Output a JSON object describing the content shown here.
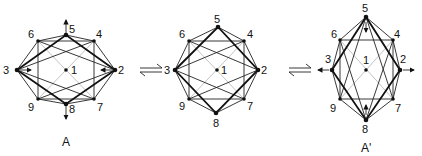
{
  "figure": {
    "type": "rearrangement-diagram",
    "panels": [
      {
        "id": "A",
        "caption": "A",
        "nodes": {
          "1": [
            66,
            70
          ],
          "2": [
            115,
            70
          ],
          "3": [
            17,
            70
          ],
          "4": [
            94,
            41
          ],
          "5": [
            66,
            35
          ],
          "6": [
            38,
            41
          ],
          "7": [
            94,
            99
          ],
          "8": [
            66,
            104
          ],
          "9": [
            38,
            99
          ]
        },
        "arrows": [
          "5-up",
          "8-down",
          "3-inward",
          "2-inward"
        ]
      },
      {
        "id": "B",
        "caption": "",
        "nodes": {
          "1": [
            217,
            70
          ],
          "2": [
            258,
            70
          ],
          "3": [
            175,
            70
          ],
          "4": [
            244,
            41
          ],
          "5": [
            218,
            27
          ],
          "6": [
            189,
            41
          ],
          "7": [
            244,
            99
          ],
          "8": [
            216,
            113
          ],
          "9": [
            189,
            99
          ]
        },
        "arrows": []
      },
      {
        "id": "A'",
        "caption": "A'",
        "nodes": {
          "1": [
            366,
            70
          ],
          "2": [
            400,
            70
          ],
          "3": [
            332,
            70
          ],
          "4": [
            393,
            40
          ],
          "5": [
            366,
            17
          ],
          "6": [
            340,
            40
          ],
          "7": [
            393,
            99
          ],
          "8": [
            366,
            120
          ],
          "9": [
            340,
            99
          ]
        },
        "arrows": [
          "5-down",
          "8-up",
          "3-outward",
          "2-outward"
        ]
      }
    ],
    "equilibrium_symbols": [
      "⇌",
      "⇌"
    ],
    "node_labels": [
      "1",
      "2",
      "3",
      "4",
      "5",
      "6",
      "7",
      "8",
      "9"
    ]
  }
}
